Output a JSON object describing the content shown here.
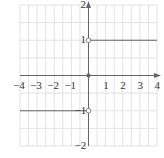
{
  "chart_data": {
    "type": "line",
    "title": "",
    "xlabel": "",
    "ylabel": "",
    "xlim": [
      -4,
      4
    ],
    "ylim": [
      -2,
      2
    ],
    "grid": true,
    "grid_step": 0.5,
    "x_ticks": [
      "−4",
      "−3",
      "−2",
      "−1",
      "1",
      "2",
      "3",
      "4"
    ],
    "x_tick_values": [
      -4,
      -3,
      -2,
      -1,
      1,
      2,
      3,
      4
    ],
    "y_ticks": [
      "2",
      "1",
      "−1",
      "−2"
    ],
    "y_tick_values": [
      2,
      1,
      -1,
      -2
    ],
    "series": [
      {
        "name": "left piece",
        "x": [
          -4,
          0
        ],
        "y": [
          -1,
          -1
        ],
        "endpoint_open": "right"
      },
      {
        "name": "right piece",
        "x": [
          0,
          4
        ],
        "y": [
          1,
          1
        ],
        "endpoint_open": "left"
      }
    ],
    "points": [
      {
        "x": 0,
        "y": 1,
        "style": "open"
      },
      {
        "x": 0,
        "y": -1,
        "style": "open"
      },
      {
        "x": 0,
        "y": 0,
        "style": "closed"
      }
    ]
  },
  "colors": {
    "grid": "#e2e2e2",
    "axis": "#666666",
    "line": "#666666"
  }
}
